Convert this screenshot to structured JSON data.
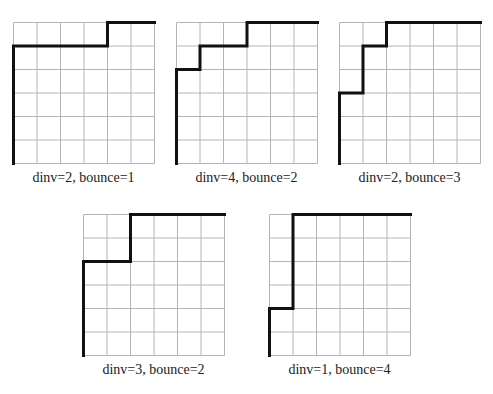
{
  "figure": {
    "grid_size": 6,
    "cell_px": 23.5,
    "grid_color": "#b4b4b4",
    "path_color": "#111111",
    "panels": [
      {
        "id": "p1",
        "caption": "dinv=2, bounce=1",
        "origin": [
          13,
          22
        ],
        "path": [
          [
            0,
            6
          ],
          [
            0,
            1
          ],
          [
            4,
            1
          ],
          [
            4,
            0
          ],
          [
            6,
            0
          ]
        ]
      },
      {
        "id": "p2",
        "caption": "dinv=4, bounce=2",
        "origin": [
          176,
          22
        ],
        "path": [
          [
            0,
            6
          ],
          [
            0,
            2
          ],
          [
            1,
            2
          ],
          [
            1,
            1
          ],
          [
            3,
            1
          ],
          [
            3,
            0
          ],
          [
            6,
            0
          ]
        ]
      },
      {
        "id": "p3",
        "caption": "dinv=2, bounce=3",
        "origin": [
          339,
          22
        ],
        "path": [
          [
            0,
            6
          ],
          [
            0,
            3
          ],
          [
            1,
            3
          ],
          [
            1,
            1
          ],
          [
            2,
            1
          ],
          [
            2,
            0
          ],
          [
            6,
            0
          ]
        ]
      },
      {
        "id": "p4",
        "caption": "dinv=3, bounce=2",
        "origin": [
          83,
          214
        ],
        "path": [
          [
            0,
            6
          ],
          [
            0,
            2
          ],
          [
            2,
            2
          ],
          [
            2,
            0
          ],
          [
            6,
            0
          ]
        ]
      },
      {
        "id": "p5",
        "caption": "dinv=1, bounce=4",
        "origin": [
          269,
          214
        ],
        "path": [
          [
            0,
            6
          ],
          [
            0,
            4
          ],
          [
            1,
            4
          ],
          [
            1,
            0
          ],
          [
            6,
            0
          ]
        ]
      }
    ]
  }
}
